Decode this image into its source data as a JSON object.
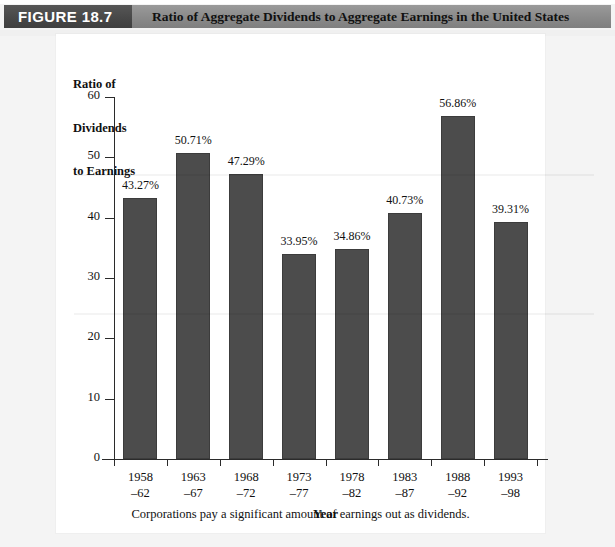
{
  "header": {
    "figure_tag": "FIGURE 18.7",
    "title": "Ratio of Aggregate Dividends to Aggregate Earnings in the United States",
    "tag_bg_color": "#4a4a4a",
    "band_bg_color": "#8e8e8e"
  },
  "caption": "Corporations pay a significant amount of earnings out as dividends.",
  "chart_data": {
    "type": "bar",
    "title": "Ratio of Aggregate Dividends to Aggregate Earnings in the United States",
    "xlabel": "Year",
    "ylabel": "Ratio of\nDividends\nto Earnings",
    "ylabel_line1": "Ratio of",
    "ylabel_line2": "Dividends",
    "ylabel_line3": "to Earnings",
    "ylim": [
      0,
      60
    ],
    "yticks": [
      0,
      10,
      20,
      30,
      40,
      50,
      60
    ],
    "ytick_labels": [
      "0",
      "10",
      "20",
      "30",
      "40",
      "50",
      "60"
    ],
    "grid": false,
    "legend": null,
    "bar_color": "#4c4c4c",
    "categories": [
      "1958\n–62",
      "1963\n–67",
      "1968\n–72",
      "1973\n–77",
      "1978\n–82",
      "1983\n–87",
      "1988\n–92",
      "1993\n–98"
    ],
    "category_lines": [
      {
        "top": "1958",
        "bottom": "–62"
      },
      {
        "top": "1963",
        "bottom": "–67"
      },
      {
        "top": "1968",
        "bottom": "–72"
      },
      {
        "top": "1973",
        "bottom": "–77"
      },
      {
        "top": "1978",
        "bottom": "–82"
      },
      {
        "top": "1983",
        "bottom": "–87"
      },
      {
        "top": "1988",
        "bottom": "–92"
      },
      {
        "top": "1993",
        "bottom": "–98"
      }
    ],
    "values": [
      43.27,
      50.71,
      47.29,
      33.95,
      34.86,
      40.73,
      56.86,
      39.31
    ],
    "data_labels": [
      "43.27%",
      "50.71%",
      "47.29%",
      "33.95%",
      "34.86%",
      "40.73%",
      "56.86%",
      "39.31%"
    ]
  }
}
